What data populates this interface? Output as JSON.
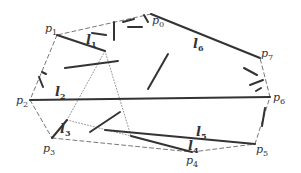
{
  "diagram": {
    "colors": {
      "segment": "#333333",
      "hull": "#777777",
      "dotted": "#888888",
      "label": "#333333"
    },
    "points": [
      {
        "id": "p0",
        "base": "p",
        "sub": "0",
        "x": 151,
        "y": 14,
        "lx": 152,
        "ly": 24
      },
      {
        "id": "p1",
        "base": "p",
        "sub": "1",
        "x": 57,
        "y": 35,
        "lx": 45,
        "ly": 32
      },
      {
        "id": "p2",
        "base": "p",
        "sub": "2",
        "x": 30,
        "y": 100,
        "lx": 16,
        "ly": 104
      },
      {
        "id": "p3",
        "base": "p",
        "sub": "3",
        "x": 52,
        "y": 138,
        "lx": 43,
        "ly": 152
      },
      {
        "id": "p4",
        "base": "p",
        "sub": "4",
        "x": 192,
        "y": 152,
        "lx": 186,
        "ly": 164
      },
      {
        "id": "p5",
        "base": "p",
        "sub": "5",
        "x": 255,
        "y": 144,
        "lx": 256,
        "ly": 153
      },
      {
        "id": "p6",
        "base": "p",
        "sub": "6",
        "x": 270,
        "y": 97,
        "lx": 273,
        "ly": 101
      },
      {
        "id": "p7",
        "base": "p",
        "sub": "7",
        "x": 260,
        "y": 58,
        "lx": 261,
        "ly": 57
      }
    ],
    "labeled_segments": [
      {
        "id": "l1",
        "base": "l",
        "sub": "1",
        "x1": 57,
        "y1": 35,
        "x2": 105,
        "y2": 51,
        "lx": 86,
        "ly": 44
      },
      {
        "id": "l2",
        "base": "l",
        "sub": "2",
        "x1": 30,
        "y1": 100,
        "x2": 270,
        "y2": 97,
        "lx": 55,
        "ly": 96
      },
      {
        "id": "l3",
        "base": "l",
        "sub": "3",
        "x1": 67,
        "y1": 120,
        "x2": 52,
        "y2": 138,
        "lx": 60,
        "ly": 133
      },
      {
        "id": "l4",
        "base": "l",
        "sub": "4",
        "x1": 131,
        "y1": 136,
        "x2": 192,
        "y2": 152,
        "lx": 188,
        "ly": 150
      },
      {
        "id": "l5",
        "base": "l",
        "sub": "5",
        "x1": 105,
        "y1": 130,
        "x2": 255,
        "y2": 144,
        "lx": 196,
        "ly": 136
      },
      {
        "id": "l6",
        "base": "l",
        "sub": "6",
        "x1": 151,
        "y1": 14,
        "x2": 260,
        "y2": 58,
        "lx": 193,
        "ly": 48
      }
    ],
    "unlabeled_segments": [
      {
        "x1": 65,
        "y1": 68,
        "x2": 118,
        "y2": 61
      },
      {
        "x1": 148,
        "y1": 89,
        "x2": 168,
        "y2": 54
      },
      {
        "x1": 90,
        "y1": 132,
        "x2": 120,
        "y2": 112
      },
      {
        "x1": 114,
        "y1": 22,
        "x2": 114,
        "y2": 40
      },
      {
        "x1": 128,
        "y1": 27,
        "x2": 142,
        "y2": 27
      },
      {
        "x1": 92,
        "y1": 33,
        "x2": 106,
        "y2": 35
      },
      {
        "x1": 123,
        "y1": 22,
        "x2": 134,
        "y2": 19
      },
      {
        "x1": 144,
        "y1": 15,
        "x2": 148,
        "y2": 22
      },
      {
        "x1": 39,
        "y1": 77,
        "x2": 43,
        "y2": 87
      },
      {
        "x1": 42,
        "y1": 72,
        "x2": 46,
        "y2": 74
      },
      {
        "x1": 244,
        "y1": 68,
        "x2": 257,
        "y2": 75
      },
      {
        "x1": 250,
        "y1": 85,
        "x2": 263,
        "y2": 80
      },
      {
        "x1": 256,
        "y1": 91,
        "x2": 261,
        "y2": 88
      },
      {
        "x1": 265,
        "y1": 108,
        "x2": 262,
        "y2": 126
      }
    ],
    "hull_edges": [
      {
        "x1": 151,
        "y1": 14,
        "x2": 57,
        "y2": 35
      },
      {
        "x1": 57,
        "y1": 35,
        "x2": 30,
        "y2": 100
      },
      {
        "x1": 30,
        "y1": 100,
        "x2": 52,
        "y2": 138
      },
      {
        "x1": 52,
        "y1": 138,
        "x2": 192,
        "y2": 152
      },
      {
        "x1": 192,
        "y1": 152,
        "x2": 255,
        "y2": 144
      },
      {
        "x1": 255,
        "y1": 144,
        "x2": 270,
        "y2": 97
      },
      {
        "x1": 270,
        "y1": 97,
        "x2": 260,
        "y2": 58
      }
    ],
    "dotted_edges": [
      {
        "x1": 105,
        "y1": 51,
        "x2": 67,
        "y2": 120
      },
      {
        "x1": 105,
        "y1": 51,
        "x2": 131,
        "y2": 136
      },
      {
        "x1": 67,
        "y1": 120,
        "x2": 131,
        "y2": 136
      }
    ]
  }
}
